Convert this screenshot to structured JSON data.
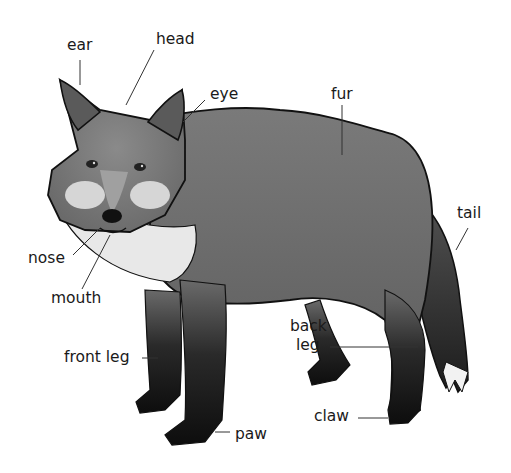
{
  "diagram": {
    "style": "grayscale illustration",
    "labels": [
      {
        "id": "ear",
        "text": "ear",
        "x": 67,
        "y": 37
      },
      {
        "id": "head",
        "text": "head",
        "x": 156,
        "y": 31
      },
      {
        "id": "eye",
        "text": "eye",
        "x": 210,
        "y": 86
      },
      {
        "id": "fur",
        "text": "fur",
        "x": 331,
        "y": 86
      },
      {
        "id": "tail",
        "text": "tail",
        "x": 457,
        "y": 205
      },
      {
        "id": "nose",
        "text": "nose",
        "x": 28,
        "y": 250
      },
      {
        "id": "mouth",
        "text": "mouth",
        "x": 51,
        "y": 290
      },
      {
        "id": "front-leg",
        "text": "front leg",
        "x": 64,
        "y": 349
      },
      {
        "id": "back",
        "text": "back",
        "x": 290,
        "y": 318
      },
      {
        "id": "leg",
        "text": "leg",
        "x": 296,
        "y": 337
      },
      {
        "id": "claw",
        "text": "claw",
        "x": 314,
        "y": 408
      },
      {
        "id": "paw",
        "text": "paw",
        "x": 235,
        "y": 426
      }
    ]
  }
}
